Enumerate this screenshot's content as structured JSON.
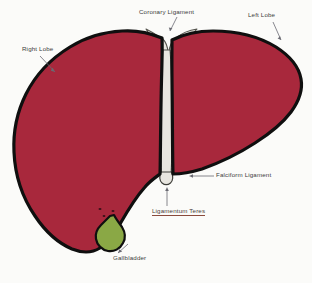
{
  "figure": {
    "background_color": "#fbfbf9"
  },
  "colors": {
    "liver": "#a8283c",
    "liver_outline": "#111111",
    "ligament": "#e8e6e0",
    "ligament_outline": "#4a4a46",
    "gallbladder": "#8aa845",
    "gallbladder_outline": "#111111",
    "label_text": "#3b3b3b",
    "leader_line": "#6a6a72",
    "underline": "#8a4a3c"
  },
  "labels": {
    "coronary_ligament": "Coronary Ligament",
    "left_lobe": "Left Lobe",
    "right_lobe": "Right Lobe",
    "falciform_ligament": "Falciform  Ligament",
    "ligamentum_teres": "Ligamentum Teres",
    "gallbladder": "Gallbladder"
  },
  "structures": [
    {
      "name": "right-lobe",
      "color": "#a8283c"
    },
    {
      "name": "left-lobe",
      "color": "#a8283c"
    },
    {
      "name": "coronary-ligament",
      "color": "#e8e6e0"
    },
    {
      "name": "falciform-ligament",
      "color": "#e8e6e0"
    },
    {
      "name": "ligamentum-teres",
      "color": "#e8e6e0"
    },
    {
      "name": "gallbladder",
      "color": "#8aa845"
    }
  ]
}
